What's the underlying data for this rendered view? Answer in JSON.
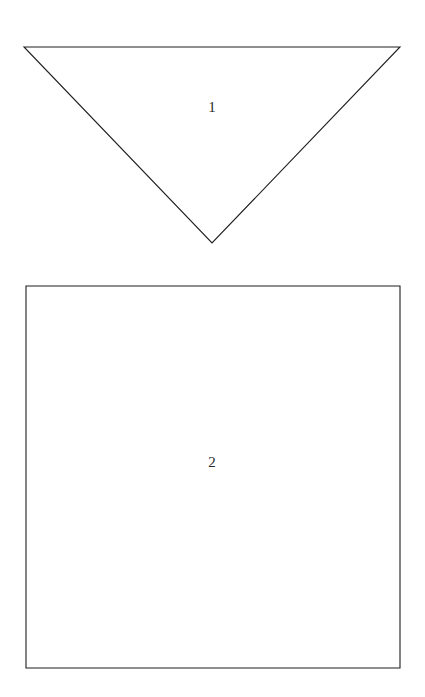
{
  "document": {
    "kind": "geometry-figure-sheet",
    "background_color": "#ffffff",
    "stroke_color": "#1e1e1e",
    "label_color": "#2a2a2a",
    "width": 425,
    "height": 697
  },
  "figures": [
    {
      "id": "figure-1",
      "shape": "triangle",
      "orientation": "inverted",
      "label": "1",
      "label_x": 212,
      "label_y": 107,
      "points": "24,47 400,47 212,243",
      "vertices": [
        {
          "x": 24,
          "y": 47
        },
        {
          "x": 400,
          "y": 47
        },
        {
          "x": 212,
          "y": 243
        }
      ]
    },
    {
      "id": "figure-2",
      "shape": "square",
      "orientation": "upright",
      "label": "2",
      "label_x": 212,
      "label_y": 462,
      "points": "26,286 400,286 400,668 26,668",
      "vertices": [
        {
          "x": 26,
          "y": 286
        },
        {
          "x": 400,
          "y": 286
        },
        {
          "x": 400,
          "y": 668
        },
        {
          "x": 26,
          "y": 668
        }
      ]
    }
  ]
}
